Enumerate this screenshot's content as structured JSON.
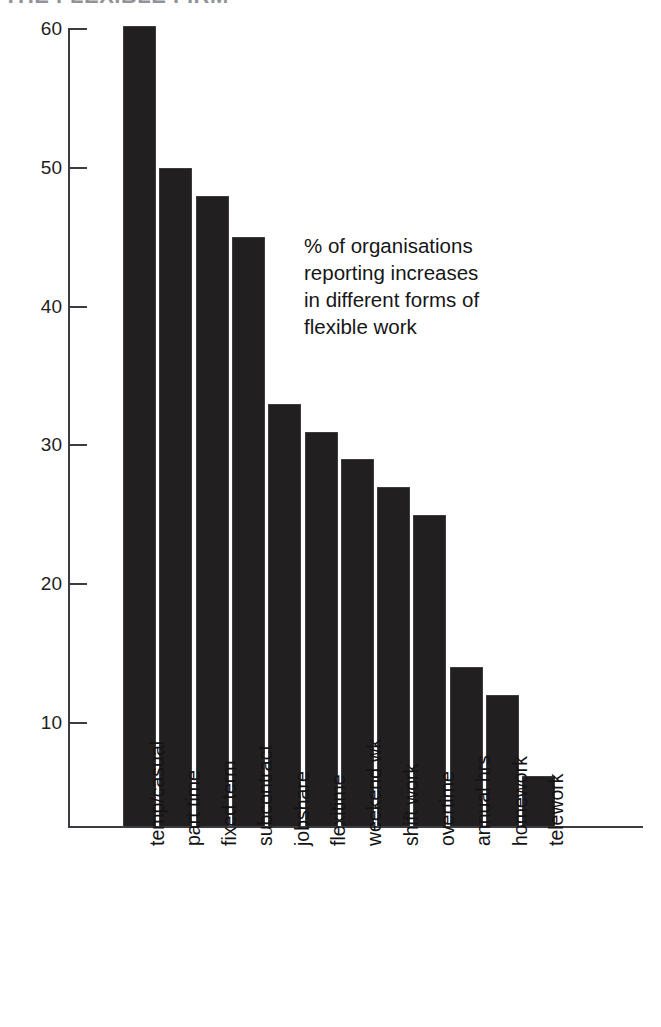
{
  "title": {
    "text": "THE FLEXIBLE FIRM",
    "note": "cropped at top edge, largely illegible"
  },
  "annotation": {
    "line1": "% of organisations",
    "line2": "reporting increases",
    "line3": "in different forms of",
    "line4": "flexible work"
  },
  "chart_data": {
    "type": "bar",
    "title": "",
    "xlabel": "",
    "ylabel": "",
    "ylim": [
      0,
      62
    ],
    "grid": false,
    "legend": null,
    "orientation": "vertical",
    "bar_color": "#211f20",
    "categories": [
      "temp/casual",
      "part time",
      "fixed term",
      "subcontract",
      "jobshare",
      "flexitime",
      "weekend wk",
      "shift work",
      "overtime",
      "annual hrs",
      "homework",
      "telework"
    ],
    "values": [
      60.2,
      50,
      48,
      45,
      33,
      31,
      29,
      27,
      25,
      14,
      12,
      6.2
    ],
    "yticks": [
      10,
      20,
      30,
      40,
      50,
      60
    ],
    "ytick_labels": [
      "10",
      "20",
      "30",
      "40",
      "50",
      "60"
    ]
  }
}
